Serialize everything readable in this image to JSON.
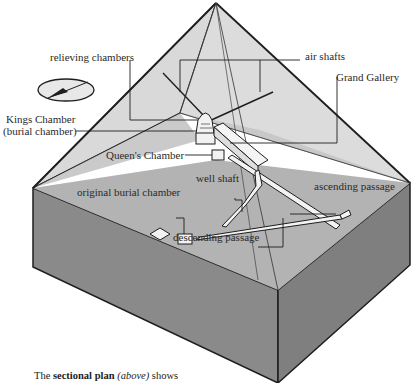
{
  "diagram": {
    "colors": {
      "background": "#ffffff",
      "pyramid_face_light": "#d9d9d9",
      "pyramid_face_mid": "#c4c4c4",
      "ground_top": "#b3b3b3",
      "ground_side_left": "#8a8a8a",
      "ground_side_right": "#7f7f7f",
      "outline": "#1e1e1e",
      "chamber_fill": "#f2f2f2"
    },
    "labels": {
      "relieving_chambers": "relieving chambers",
      "air_shafts": "air shafts",
      "grand_gallery": "Grand Gallery",
      "kings_chamber_line1": "Kings Chamber",
      "kings_chamber_line2": "(burial chamber)",
      "queens_chamber": "Queen's Chamber",
      "well_shaft": "well shaft",
      "ascending_passage": "ascending passage",
      "original_burial_chamber": "original burial chamber",
      "descending_passage": "descending passage"
    },
    "compass": {
      "icon": "compass-arrow-icon",
      "direction": "north-east"
    },
    "caption": {
      "prefix": "The ",
      "bold": "sectional plan",
      "space": " ",
      "italic": "(above)",
      "suffix": " shows"
    }
  }
}
